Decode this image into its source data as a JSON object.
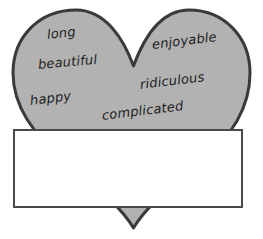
{
  "figure": {
    "type": "word-cloud-heart",
    "shape_name": "heart",
    "fill_color": "#b2b2b2",
    "stroke_color": "#3a3a3a",
    "background_color": "#ffffff",
    "text_color": "#1d1d1d"
  },
  "words": [
    {
      "label": "long",
      "x": 47,
      "y": 28,
      "size": 13,
      "rotate": -6
    },
    {
      "label": "enjoyable",
      "x": 152,
      "y": 38,
      "size": 13,
      "rotate": -7
    },
    {
      "label": "beautiful",
      "x": 38,
      "y": 58,
      "size": 13,
      "rotate": -5
    },
    {
      "label": "ridiculous",
      "x": 140,
      "y": 78,
      "size": 13,
      "rotate": -7
    },
    {
      "label": "happy",
      "x": 30,
      "y": 94,
      "size": 13,
      "rotate": -7
    },
    {
      "label": "complicated",
      "x": 102,
      "y": 109,
      "size": 13,
      "rotate": -7
    }
  ],
  "answer_box": {
    "name": "answer-box",
    "value": "",
    "placeholder": "",
    "x": 13,
    "y": 129,
    "width": 230,
    "height": 79,
    "border_color": "#4a4a4a",
    "fill_color": "#ffffff"
  }
}
